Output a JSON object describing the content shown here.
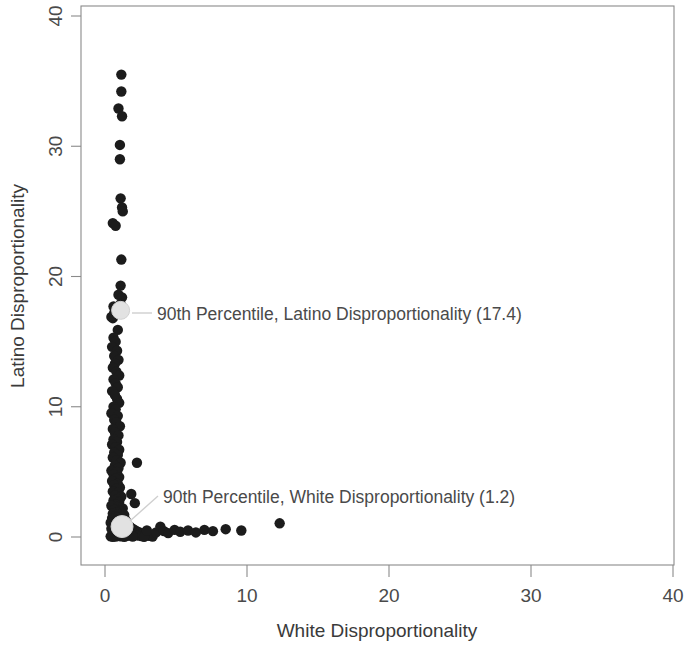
{
  "chart_data": {
    "type": "scatter",
    "title": "",
    "xlabel": "White Disproportionality",
    "ylabel": "Latino Disproportionality",
    "xlim": [
      0,
      40
    ],
    "ylim": [
      0,
      40
    ],
    "xticks": [
      "0",
      "10",
      "20",
      "30",
      "40"
    ],
    "yticks": [
      "0",
      "10",
      "20",
      "30",
      "40"
    ],
    "xtick_values": [
      0,
      10,
      20,
      30,
      40
    ],
    "ytick_values": [
      0,
      10,
      20,
      30,
      40
    ],
    "grid": false,
    "legend": "none",
    "point_color": "#1c1c1c",
    "highlight_color": "#e2e2e2",
    "annotations": [
      {
        "id": "latino-percentile",
        "label": "90th Percentile, Latino Disproportionality (17.4)",
        "value": 17.4,
        "point_x": 1.1,
        "point_y": 17.4
      },
      {
        "id": "white-percentile",
        "label": "90th Percentile, White Disproportionality (1.2)",
        "value": 1.2,
        "point_x": 1.2,
        "point_y": 0.8
      }
    ],
    "points": [
      [
        1.15,
        35.5
      ],
      [
        1.15,
        34.2
      ],
      [
        0.95,
        32.9
      ],
      [
        1.2,
        32.3
      ],
      [
        1.05,
        30.1
      ],
      [
        1.05,
        29.0
      ],
      [
        1.1,
        26.0
      ],
      [
        1.2,
        25.3
      ],
      [
        1.25,
        25.0
      ],
      [
        0.55,
        24.1
      ],
      [
        0.75,
        23.9
      ],
      [
        1.15,
        21.3
      ],
      [
        1.1,
        19.3
      ],
      [
        0.95,
        18.6
      ],
      [
        1.2,
        18.4
      ],
      [
        1.1,
        17.9
      ],
      [
        0.6,
        17.7
      ],
      [
        0.65,
        17.2
      ],
      [
        0.45,
        16.9
      ],
      [
        0.55,
        16.8
      ],
      [
        0.9,
        15.9
      ],
      [
        0.6,
        15.3
      ],
      [
        0.75,
        15.0
      ],
      [
        0.5,
        14.6
      ],
      [
        0.85,
        14.3
      ],
      [
        0.65,
        13.9
      ],
      [
        0.95,
        13.6
      ],
      [
        0.7,
        13.3
      ],
      [
        0.55,
        13.0
      ],
      [
        0.8,
        12.7
      ],
      [
        1.0,
        12.4
      ],
      [
        0.6,
        12.1
      ],
      [
        0.75,
        11.8
      ],
      [
        0.9,
        11.5
      ],
      [
        0.5,
        11.2
      ],
      [
        0.7,
        10.9
      ],
      [
        0.85,
        10.6
      ],
      [
        1.0,
        10.3
      ],
      [
        0.6,
        10.0
      ],
      [
        0.75,
        9.8
      ],
      [
        0.45,
        9.5
      ],
      [
        0.9,
        9.3
      ],
      [
        0.65,
        9.0
      ],
      [
        0.8,
        8.8
      ],
      [
        1.05,
        8.5
      ],
      [
        0.55,
        8.3
      ],
      [
        0.7,
        8.0
      ],
      [
        0.95,
        7.8
      ],
      [
        0.6,
        7.5
      ],
      [
        0.85,
        7.3
      ],
      [
        0.5,
        7.1
      ],
      [
        0.75,
        6.9
      ],
      [
        1.0,
        6.7
      ],
      [
        0.65,
        6.5
      ],
      [
        0.9,
        6.3
      ],
      [
        0.55,
        6.1
      ],
      [
        0.8,
        5.9
      ],
      [
        1.1,
        5.7
      ],
      [
        0.7,
        5.5
      ],
      [
        0.95,
        5.3
      ],
      [
        0.45,
        5.1
      ],
      [
        0.85,
        5.0
      ],
      [
        0.6,
        4.8
      ],
      [
        1.0,
        4.6
      ],
      [
        0.75,
        4.5
      ],
      [
        0.5,
        4.3
      ],
      [
        0.9,
        4.1
      ],
      [
        0.65,
        4.0
      ],
      [
        1.05,
        3.8
      ],
      [
        0.8,
        3.7
      ],
      [
        0.55,
        3.5
      ],
      [
        0.95,
        3.4
      ],
      [
        0.7,
        3.2
      ],
      [
        1.15,
        3.1
      ],
      [
        0.85,
        2.9
      ],
      [
        0.6,
        2.8
      ],
      [
        1.0,
        2.7
      ],
      [
        0.75,
        2.5
      ],
      [
        0.45,
        2.4
      ],
      [
        0.9,
        2.3
      ],
      [
        1.25,
        2.2
      ],
      [
        0.65,
        2.1
      ],
      [
        1.1,
        2.0
      ],
      [
        0.8,
        1.9
      ],
      [
        0.55,
        1.8
      ],
      [
        0.95,
        1.75
      ],
      [
        1.35,
        1.7
      ],
      [
        0.7,
        1.6
      ],
      [
        1.2,
        1.55
      ],
      [
        0.85,
        1.5
      ],
      [
        0.5,
        1.45
      ],
      [
        1.05,
        1.4
      ],
      [
        0.6,
        1.35
      ],
      [
        1.45,
        1.3
      ],
      [
        0.75,
        1.25
      ],
      [
        1.15,
        1.2
      ],
      [
        0.9,
        1.15
      ],
      [
        0.4,
        1.1
      ],
      [
        1.3,
        1.05
      ],
      [
        0.65,
        1.0
      ],
      [
        1.0,
        0.98
      ],
      [
        1.6,
        0.95
      ],
      [
        0.8,
        0.92
      ],
      [
        1.4,
        0.9
      ],
      [
        0.5,
        0.88
      ],
      [
        1.1,
        0.85
      ],
      [
        0.7,
        0.82
      ],
      [
        1.75,
        0.8
      ],
      [
        0.95,
        0.78
      ],
      [
        1.25,
        0.75
      ],
      [
        0.6,
        0.72
      ],
      [
        1.55,
        0.7
      ],
      [
        0.85,
        0.68
      ],
      [
        1.9,
        0.66
      ],
      [
        0.45,
        0.64
      ],
      [
        1.35,
        0.62
      ],
      [
        1.05,
        0.6
      ],
      [
        0.75,
        0.58
      ],
      [
        2.05,
        0.56
      ],
      [
        1.65,
        0.54
      ],
      [
        0.9,
        0.52
      ],
      [
        0.55,
        0.5
      ],
      [
        1.45,
        0.48
      ],
      [
        2.2,
        0.46
      ],
      [
        1.15,
        0.44
      ],
      [
        0.7,
        0.42
      ],
      [
        1.8,
        0.4
      ],
      [
        0.95,
        0.38
      ],
      [
        2.4,
        0.36
      ],
      [
        1.3,
        0.34
      ],
      [
        0.6,
        0.32
      ],
      [
        1.6,
        0.3
      ],
      [
        2.65,
        0.28
      ],
      [
        1.0,
        0.26
      ],
      [
        0.8,
        0.24
      ],
      [
        2.0,
        0.22
      ],
      [
        1.4,
        0.2
      ],
      [
        0.5,
        0.18
      ],
      [
        2.85,
        0.17
      ],
      [
        1.2,
        0.16
      ],
      [
        1.7,
        0.14
      ],
      [
        0.65,
        0.13
      ],
      [
        2.3,
        0.12
      ],
      [
        0.9,
        0.1
      ],
      [
        3.1,
        0.09
      ],
      [
        1.5,
        0.08
      ],
      [
        2.55,
        0.07
      ],
      [
        1.1,
        0.06
      ],
      [
        0.4,
        0.05
      ],
      [
        1.95,
        0.04
      ],
      [
        3.35,
        0.04
      ],
      [
        0.75,
        0.03
      ],
      [
        2.75,
        0.02
      ],
      [
        1.35,
        0.02
      ],
      [
        0.55,
        0.01
      ],
      [
        2.25,
        5.7
      ],
      [
        1.85,
        3.3
      ],
      [
        2.1,
        2.6
      ],
      [
        2.95,
        0.5
      ],
      [
        3.6,
        0.35
      ],
      [
        3.9,
        0.8
      ],
      [
        4.15,
        0.45
      ],
      [
        4.45,
        0.3
      ],
      [
        4.9,
        0.55
      ],
      [
        5.3,
        0.4
      ],
      [
        5.85,
        0.5
      ],
      [
        6.4,
        0.35
      ],
      [
        7.0,
        0.55
      ],
      [
        7.6,
        0.45
      ],
      [
        8.5,
        0.6
      ],
      [
        9.6,
        0.5
      ],
      [
        12.3,
        1.05
      ]
    ]
  }
}
